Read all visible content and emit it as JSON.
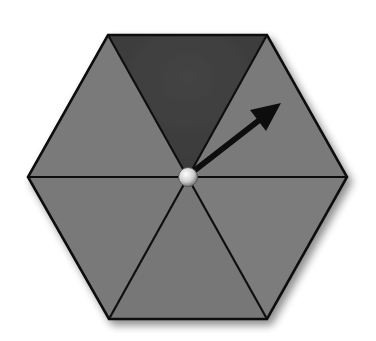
{
  "diagram": {
    "type": "spinner",
    "shape": "hexagon",
    "sections": 6,
    "shaded_sections": 1,
    "colors": {
      "background": "#ffffff",
      "section_light": "#787878",
      "section_dark": "#3e3e3e",
      "outline": "#111111",
      "arrow": "#111111",
      "pivot": "#d9d9d9"
    },
    "arrow_points_to": "upper-right section"
  }
}
